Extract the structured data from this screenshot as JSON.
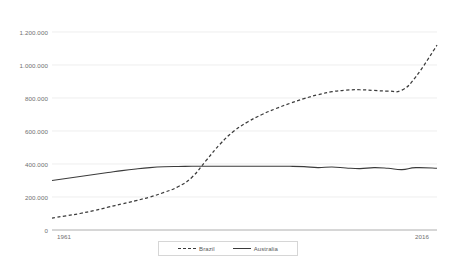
{
  "chart_data": {
    "type": "line",
    "title": "",
    "subtitle": "",
    "xlabel": "",
    "ylabel": "",
    "xlim": [
      1961,
      2016
    ],
    "ylim": [
      0,
      1200000
    ],
    "grid": true,
    "legend_position": "bottom",
    "y_ticks": [
      "0",
      "200.000",
      "400.000",
      "600.000",
      "800.000",
      "1.000.000",
      "1.200.000"
    ],
    "y_tick_values": [
      0,
      200000,
      400000,
      600000,
      800000,
      1000000,
      1200000
    ],
    "x_ticks": [
      "1961",
      "2016"
    ],
    "x_tick_values": [
      1961,
      2016
    ],
    "x": [
      1961,
      1963,
      1965,
      1967,
      1969,
      1971,
      1973,
      1975,
      1977,
      1979,
      1981,
      1983,
      1985,
      1987,
      1989,
      1991,
      1993,
      1995,
      1997,
      1999,
      2001,
      2003,
      2005,
      2007,
      2009,
      2011,
      2013,
      2016
    ],
    "series": [
      {
        "name": "Brazil",
        "style": "dashed",
        "color": "#3b3b3b",
        "values": [
          72000,
          86000,
          100000,
          118000,
          138000,
          158000,
          178000,
          200000,
          228000,
          262000,
          320000,
          420000,
          520000,
          600000,
          656000,
          700000,
          736000,
          768000,
          796000,
          820000,
          838000,
          848000,
          850000,
          846000,
          842000,
          848000,
          930000,
          1120000
        ]
      },
      {
        "name": "Australia",
        "style": "solid",
        "color": "#3b3b3b",
        "values": [
          300000,
          312000,
          324000,
          336000,
          348000,
          360000,
          370000,
          378000,
          383000,
          385000,
          386000,
          386000,
          386000,
          386000,
          386000,
          386000,
          386000,
          386000,
          384000,
          378000,
          382000,
          376000,
          372000,
          378000,
          374000,
          366000,
          378000,
          374000
        ]
      }
    ]
  },
  "legend": {
    "items": [
      {
        "label": "Brazil",
        "style": "dashed"
      },
      {
        "label": "Australia",
        "style": "solid"
      }
    ]
  }
}
